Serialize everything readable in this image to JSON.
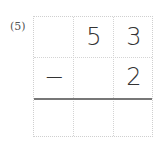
{
  "problem": {
    "label": "(5)",
    "operator": "−",
    "rows": [
      [
        "",
        "5",
        "3"
      ],
      [
        "−",
        "",
        "2"
      ],
      [
        "",
        "",
        ""
      ]
    ]
  }
}
